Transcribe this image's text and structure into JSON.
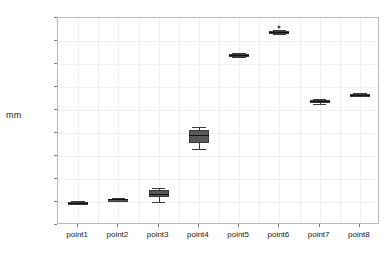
{
  "chart_data": {
    "type": "box",
    "title": "",
    "xlabel": "",
    "ylabel": "mm",
    "ylim": [
      0,
      900
    ],
    "yticks": [
      0,
      100,
      200,
      300,
      400,
      500,
      600,
      700,
      800,
      900
    ],
    "ytick_labels": [
      "0",
      "100",
      "200",
      "300",
      "400",
      "500",
      "600",
      "700",
      "800",
      "900"
    ],
    "categories": [
      "point1",
      "point2",
      "point3",
      "point4",
      "point5",
      "point6",
      "point7",
      "point8"
    ],
    "grid": true,
    "legend": "none",
    "boxes": [
      {
        "category": "point1",
        "whisker_low": 90,
        "q1": 94,
        "median": 97,
        "q3": 100,
        "whisker_high": 103,
        "outliers": []
      },
      {
        "category": "point2",
        "whisker_low": 105,
        "q1": 108,
        "median": 111,
        "q3": 113,
        "whisker_high": 116,
        "outliers": []
      },
      {
        "category": "point3",
        "whisker_low": 98,
        "q1": 120,
        "median": 135,
        "q3": 152,
        "whisker_high": 163,
        "outliers": []
      },
      {
        "category": "point4",
        "whisker_low": 330,
        "q1": 355,
        "median": 390,
        "q3": 415,
        "whisker_high": 425,
        "outliers": []
      },
      {
        "category": "point5",
        "whisker_low": 730,
        "q1": 735,
        "median": 740,
        "q3": 745,
        "whisker_high": 748,
        "outliers": []
      },
      {
        "category": "point6",
        "whisker_low": 832,
        "q1": 836,
        "median": 840,
        "q3": 845,
        "whisker_high": 850,
        "outliers": [
          862
        ]
      },
      {
        "category": "point7",
        "whisker_low": 528,
        "q1": 533,
        "median": 538,
        "q3": 543,
        "whisker_high": 547,
        "outliers": []
      },
      {
        "category": "point8",
        "whisker_low": 560,
        "q1": 563,
        "median": 566,
        "q3": 569,
        "whisker_high": 572,
        "outliers": []
      }
    ]
  }
}
